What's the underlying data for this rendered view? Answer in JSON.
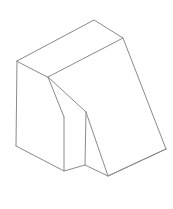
{
  "canvas": {
    "title": "isometric-solid-wireframe",
    "width": 173,
    "height": 209,
    "background_color": "#ffffff",
    "stroke_color": "#8a8a8a",
    "fill_color": "#ffffff",
    "stroke_width": 1
  },
  "geometry": {
    "description": "Line drawing of a 3D block in isometric projection: a rectangular prism with a large sloped top face and a V-shaped notch cut into the front-lower portion.",
    "vertices": {
      "top_back_apex": [
        94,
        20
      ],
      "top_right": [
        123,
        38
      ],
      "top_left_upper": [
        17,
        61
      ],
      "ridge_left": [
        48,
        77
      ],
      "left_bottom": [
        16,
        146
      ],
      "notch_top_left": [
        64,
        117
      ],
      "notch_top_apex": [
        86,
        112
      ],
      "notch_bottom_left": [
        64,
        171
      ],
      "notch_bottom_mid": [
        85,
        165
      ],
      "notch_low_point": [
        108,
        176
      ],
      "right_bottom": [
        166,
        149
      ]
    },
    "paths": {
      "top_face": "M 17 61 L 94 20 L 123 38 L 48 77 Z",
      "left_face": "M 17 61 L 48 77 L 48 77 L 64 117 L 64 171 L 16 146 Z",
      "slope_face": "M 123 38 L 166 149 L 108 176 L 86 112 L 48 77 Z",
      "notch_inner_left": "M 64 117 L 86 112 L 85 165 L 64 171 Z",
      "notch_inner_right": "M 86 112 L 108 176 L 85 165 Z",
      "front_bottom": "M 16 146 L 64 171 L 85 165 L 108 176 L 166 149",
      "edge_top_left_vertical": "M 17 61 L 16 146",
      "edge_ridge": "M 48 77 L 64 117",
      "edge_notch_left_vertical": "M 64 117 L 64 171",
      "edge_notch_apex_vertical": "M 86 112 L 85 165",
      "edge_notch_diagonal": "M 86 112 L 108 176",
      "edge_slope_ridge": "M 48 77 L 86 112",
      "edge_right_slope": "M 123 38 L 166 149",
      "edge_right_bottom": "M 166 149 L 108 176"
    }
  }
}
